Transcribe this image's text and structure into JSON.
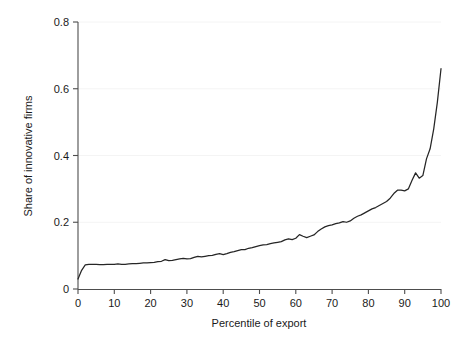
{
  "chart_data": {
    "type": "line",
    "title": "",
    "xlabel": "Percentile of export",
    "ylabel": "Share of innovative firms",
    "xlim": [
      0,
      100
    ],
    "ylim": [
      0,
      0.8
    ],
    "grid": true,
    "grid_axis": "y",
    "legend": null,
    "legend_position": "none",
    "line_color": "#262626",
    "background_color": "#ffffff",
    "gridline_color": "#f4f4f4",
    "axis_color": "#4d4d4d",
    "xticks": [
      0,
      10,
      20,
      30,
      40,
      50,
      60,
      70,
      80,
      90,
      100
    ],
    "xticklabels": [
      "0",
      "10",
      "20",
      "30",
      "40",
      "50",
      "60",
      "70",
      "80",
      "90",
      "100"
    ],
    "yticks": [
      0,
      0.2,
      0.4,
      0.6,
      0.8
    ],
    "yticklabels": [
      "0",
      "0.2",
      "0.4",
      "0.6",
      "0.8"
    ],
    "series": [
      {
        "name": "Share of innovative firms",
        "x": [
          0,
          1,
          2,
          3,
          4,
          5,
          6,
          7,
          8,
          9,
          10,
          11,
          12,
          13,
          14,
          15,
          16,
          17,
          18,
          19,
          20,
          21,
          22,
          23,
          24,
          25,
          26,
          27,
          28,
          29,
          30,
          31,
          32,
          33,
          34,
          35,
          36,
          37,
          38,
          39,
          40,
          41,
          42,
          43,
          44,
          45,
          46,
          47,
          48,
          49,
          50,
          51,
          52,
          53,
          54,
          55,
          56,
          57,
          58,
          59,
          60,
          61,
          62,
          63,
          64,
          65,
          66,
          67,
          68,
          69,
          70,
          71,
          72,
          73,
          74,
          75,
          76,
          77,
          78,
          79,
          80,
          81,
          82,
          83,
          84,
          85,
          86,
          87,
          88,
          89,
          90,
          91,
          92,
          93,
          94,
          95,
          96,
          97,
          98,
          99,
          100
        ],
        "values": [
          0.03,
          0.056,
          0.072,
          0.074,
          0.074,
          0.074,
          0.073,
          0.073,
          0.074,
          0.074,
          0.074,
          0.075,
          0.074,
          0.074,
          0.075,
          0.076,
          0.076,
          0.077,
          0.078,
          0.078,
          0.079,
          0.08,
          0.082,
          0.083,
          0.088,
          0.085,
          0.086,
          0.088,
          0.09,
          0.092,
          0.09,
          0.091,
          0.095,
          0.098,
          0.096,
          0.098,
          0.1,
          0.101,
          0.104,
          0.106,
          0.103,
          0.106,
          0.11,
          0.112,
          0.115,
          0.118,
          0.118,
          0.122,
          0.124,
          0.127,
          0.13,
          0.132,
          0.133,
          0.136,
          0.138,
          0.14,
          0.142,
          0.147,
          0.15,
          0.148,
          0.152,
          0.163,
          0.158,
          0.154,
          0.158,
          0.162,
          0.172,
          0.18,
          0.186,
          0.19,
          0.192,
          0.196,
          0.198,
          0.202,
          0.2,
          0.204,
          0.212,
          0.218,
          0.222,
          0.228,
          0.234,
          0.24,
          0.244,
          0.25,
          0.256,
          0.262,
          0.272,
          0.286,
          0.296,
          0.296,
          0.294,
          0.3,
          0.325,
          0.348,
          0.332,
          0.34,
          0.39,
          0.42,
          0.48,
          0.56,
          0.66
        ]
      }
    ]
  },
  "axes": {
    "ylabel": "Share of innovative firms",
    "xlabel": "Percentile of export"
  }
}
